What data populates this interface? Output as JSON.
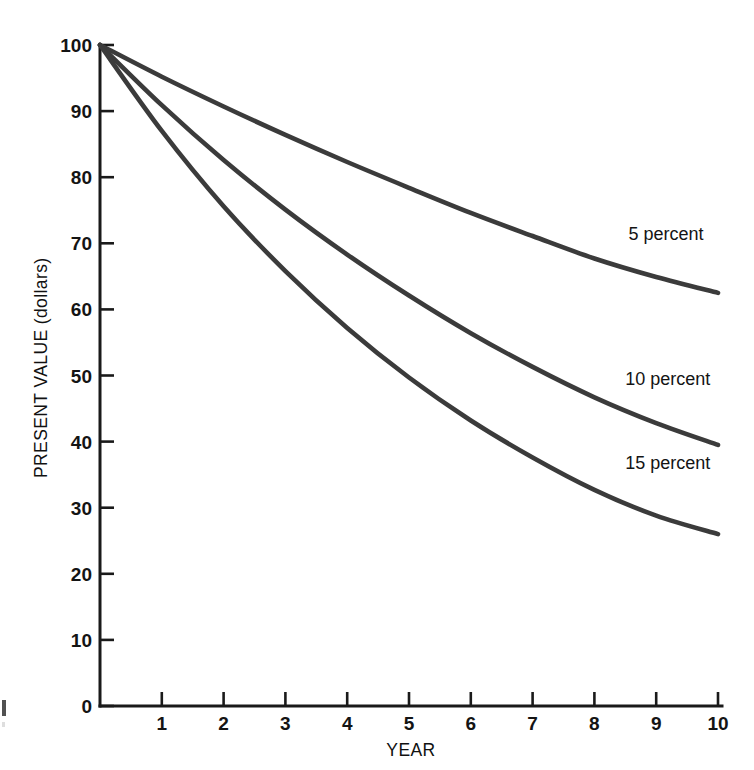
{
  "chart_data": {
    "type": "line",
    "title": "",
    "subtitle": "",
    "xlabel": "YEAR",
    "ylabel": "PRESENT VALUE (dollars)",
    "xlim": [
      0,
      10
    ],
    "ylim": [
      0,
      100
    ],
    "grid": false,
    "legend_position": "inline-right-of-curves",
    "x": [
      0,
      1,
      2,
      3,
      4,
      5,
      6,
      7,
      8,
      9,
      10
    ],
    "xticklabels": [
      "1",
      "2",
      "3",
      "4",
      "5",
      "6",
      "7",
      "8",
      "9",
      "10"
    ],
    "xtickvalues": [
      1,
      2,
      3,
      4,
      5,
      6,
      7,
      8,
      9,
      10
    ],
    "yticklabels": [
      "0",
      "10",
      "20",
      "30",
      "40",
      "50",
      "60",
      "70",
      "80",
      "90",
      "100"
    ],
    "ytickvalues": [
      0,
      10,
      20,
      30,
      40,
      50,
      60,
      70,
      80,
      90,
      100
    ],
    "series": [
      {
        "name": "5 percent",
        "rate": 5,
        "label": "5 percent",
        "label_x": 8.55,
        "label_y": 70.5,
        "color": "#3b3b3b",
        "values": [
          100,
          95.2,
          90.7,
          86.4,
          82.3,
          78.4,
          74.6,
          71.1,
          67.7,
          64.9,
          62.5
        ]
      },
      {
        "name": "10 percent",
        "rate": 10,
        "label": "10 percent",
        "label_x": 8.5,
        "label_y": 48.5,
        "color": "#3b3b3b",
        "values": [
          100,
          90.9,
          82.6,
          75.1,
          68.3,
          62.1,
          56.4,
          51.3,
          46.7,
          42.8,
          39.5
        ]
      },
      {
        "name": "15 percent",
        "rate": 15,
        "label": "15 percent",
        "label_x": 8.5,
        "label_y": 35.8,
        "color": "#3b3b3b",
        "values": [
          100,
          87.0,
          75.6,
          65.8,
          57.2,
          49.7,
          43.2,
          37.6,
          32.7,
          28.8,
          26.0
        ]
      }
    ]
  },
  "axes": {
    "y_title": "PRESENT VALUE (dollars)",
    "x_title": "YEAR"
  },
  "colors": {
    "background": "#ffffff",
    "axis": "#1a1a1a",
    "curve": "#3b3b3b",
    "text": "#141414"
  }
}
